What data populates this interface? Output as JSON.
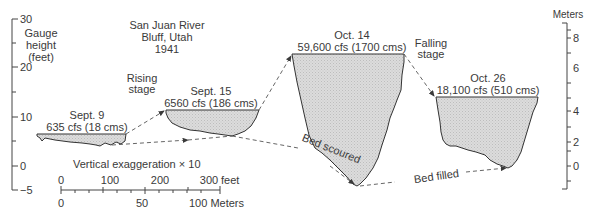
{
  "title": {
    "line1": "San Juan River",
    "line2": "Bluff, Utah",
    "line3": "1941"
  },
  "left_axis": {
    "label_line1": "Gauge",
    "label_line2": "height",
    "label_line3": "(feet)",
    "ticks": [
      "30",
      "20",
      "10",
      "0",
      "−5"
    ]
  },
  "right_axis": {
    "label": "Meters",
    "ticks": [
      "8",
      "6",
      "4",
      "2",
      "0"
    ]
  },
  "sections": [
    {
      "date": "Sept. 9",
      "discharge": "635 cfs (18 cms)"
    },
    {
      "date": "Sept. 15",
      "discharge": "6560 cfs (186 cms)"
    },
    {
      "date": "Oct. 14",
      "discharge": "59,600 cfs (1700 cms)"
    },
    {
      "date": "Oct. 26",
      "discharge": "18,100 cfs (510 cms)"
    }
  ],
  "annotations": {
    "rising_line1": "Rising",
    "rising_line2": "stage",
    "falling_line1": "Falling",
    "falling_line2": "stage",
    "bed_scoured": "Bed scoured",
    "bed_filled": "Bed filled",
    "exaggeration": "Vertical exaggeration × 10"
  },
  "scale_bar": {
    "feet_ticks": [
      "0",
      "100",
      "200",
      "300"
    ],
    "feet_unit": "feet",
    "meter_ticks": [
      "0",
      "50"
    ],
    "meter_end": "100 Meters"
  },
  "colors": {
    "ink": "#3a3a3a",
    "fill": "#d4d4d4",
    "background": "#ffffff"
  }
}
